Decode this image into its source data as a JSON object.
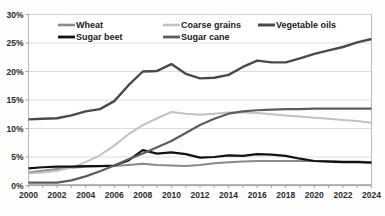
{
  "chart_data": {
    "type": "line",
    "title": "",
    "xlabel": "",
    "ylabel": "",
    "x": [
      2000,
      2001,
      2002,
      2003,
      2004,
      2005,
      2006,
      2007,
      2008,
      2009,
      2010,
      2011,
      2012,
      2013,
      2014,
      2015,
      2016,
      2017,
      2018,
      2019,
      2020,
      2021,
      2022,
      2023,
      2024
    ],
    "xlim": [
      2000,
      2024
    ],
    "ylim": [
      0,
      30
    ],
    "yticks": [
      0,
      5,
      10,
      15,
      20,
      25,
      30
    ],
    "ytick_labels": [
      "0%",
      "5%",
      "10%",
      "15%",
      "20%",
      "25%",
      "30%"
    ],
    "xticks": [
      2000,
      2002,
      2004,
      2006,
      2008,
      2010,
      2012,
      2014,
      2016,
      2018,
      2020,
      2022,
      2024
    ],
    "xtick_labels": [
      "2000",
      "2002",
      "2004",
      "2006",
      "2008",
      "2010",
      "2012",
      "2014",
      "2016",
      "2018",
      "2020",
      "2022",
      "2024"
    ],
    "grid": true,
    "legend_position": "top-inside",
    "series": [
      {
        "name": "Wheat",
        "color": "#8a8a8a",
        "width": 2.0,
        "values": [
          2.3,
          2.6,
          2.9,
          3.1,
          3.3,
          3.4,
          3.4,
          3.6,
          3.8,
          3.6,
          3.5,
          3.4,
          3.6,
          3.9,
          4.1,
          4.2,
          4.3,
          4.3,
          4.3,
          4.3,
          4.3,
          4.3,
          4.2,
          4.2,
          4.1
        ]
      },
      {
        "name": "Coarse grains",
        "color": "#c2c2c2",
        "width": 2.0,
        "values": [
          2.1,
          2.3,
          2.6,
          3.1,
          4.1,
          5.3,
          7.0,
          9.0,
          10.6,
          11.8,
          12.9,
          12.6,
          12.4,
          12.6,
          12.8,
          12.8,
          12.7,
          12.5,
          12.3,
          12.1,
          11.9,
          11.7,
          11.5,
          11.3,
          11.0
        ]
      },
      {
        "name": "Vegetable oils",
        "color": "#4a4a4a",
        "width": 2.4,
        "values": [
          11.6,
          11.7,
          11.8,
          12.3,
          13.0,
          13.4,
          14.8,
          17.6,
          20.0,
          20.1,
          21.3,
          19.6,
          18.8,
          18.9,
          19.4,
          20.8,
          21.9,
          21.6,
          21.6,
          22.3,
          23.1,
          23.7,
          24.3,
          25.1,
          25.7
        ]
      },
      {
        "name": "Sugar beet",
        "color": "#111111",
        "width": 2.2,
        "values": [
          3.0,
          3.2,
          3.3,
          3.3,
          3.4,
          3.4,
          3.5,
          4.4,
          6.2,
          5.6,
          5.8,
          5.5,
          4.9,
          5.0,
          5.3,
          5.2,
          5.5,
          5.4,
          5.2,
          4.7,
          4.3,
          4.2,
          4.1,
          4.1,
          4.0
        ]
      },
      {
        "name": "Sugar cane",
        "color": "#5d5d5d",
        "width": 2.2,
        "values": [
          0.5,
          0.5,
          0.5,
          0.9,
          1.6,
          2.5,
          3.5,
          4.6,
          5.6,
          6.7,
          7.8,
          9.2,
          10.6,
          11.7,
          12.6,
          13.0,
          13.2,
          13.3,
          13.4,
          13.4,
          13.5,
          13.5,
          13.5,
          13.5,
          13.5
        ]
      }
    ],
    "legend": [
      {
        "label": "Wheat",
        "color": "#8a8a8a",
        "width": 2.0,
        "col": 0,
        "row": 0
      },
      {
        "label": "Coarse grains",
        "color": "#c2c2c2",
        "width": 2.0,
        "col": 1,
        "row": 0
      },
      {
        "label": "Vegetable oils",
        "color": "#4a4a4a",
        "width": 2.4,
        "col": 2,
        "row": 0
      },
      {
        "label": "Sugar beet",
        "color": "#111111",
        "width": 2.2,
        "col": 0,
        "row": 1
      },
      {
        "label": "Sugar cane",
        "color": "#5d5d5d",
        "width": 2.2,
        "col": 1,
        "row": 1
      }
    ]
  }
}
